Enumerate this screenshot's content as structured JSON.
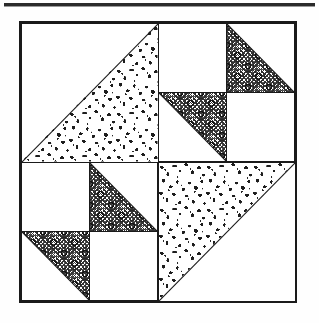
{
  "page": {
    "kind": "quilt-block-diagram",
    "width": 319,
    "height": 323,
    "background_color": "#fefefe"
  },
  "header_rule": {
    "visible": true,
    "color": "#2b2b2b"
  },
  "block": {
    "name": "quilt-block",
    "outline_color": "#1a1a1a",
    "background_color": "#ffffff",
    "grid": "2x2"
  },
  "fabrics": [
    {
      "id": "cloud",
      "label": "mottled print",
      "ink_color": "#1d1d1d",
      "ground_color": "#ffffff"
    },
    {
      "id": "medallion",
      "label": "geometric medallion print",
      "ink_color": "#141414",
      "ground_color": "#ffffff"
    },
    {
      "id": "plain",
      "label": "background solid",
      "ink_color": "none",
      "ground_color": "#ffffff"
    }
  ],
  "quadrants": [
    {
      "name": "top-left",
      "type": "half-square-triangle",
      "seam": "bl-tr",
      "patches": [
        {
          "position": "upper-left",
          "fabric": "plain"
        },
        {
          "position": "lower-right",
          "fabric": "cloud"
        }
      ]
    },
    {
      "name": "top-right",
      "type": "four-patch",
      "cells": [
        {
          "position": "top-left",
          "type": "plain",
          "fabric": "plain"
        },
        {
          "position": "top-right",
          "type": "half-square-triangle",
          "seam": "bl-tr",
          "fabric": "medallion",
          "fabric_half": "lower-left"
        },
        {
          "position": "bottom-left",
          "type": "half-square-triangle",
          "seam": "bl-tr",
          "fabric": "medallion",
          "fabric_half": "upper-right"
        },
        {
          "position": "bottom-right",
          "type": "plain",
          "fabric": "plain"
        }
      ]
    },
    {
      "name": "bottom-left",
      "type": "four-patch",
      "cells": [
        {
          "position": "top-left",
          "type": "plain",
          "fabric": "plain"
        },
        {
          "position": "top-right",
          "type": "half-square-triangle",
          "seam": "bl-tr",
          "fabric": "medallion",
          "fabric_half": "lower-left"
        },
        {
          "position": "bottom-left",
          "type": "half-square-triangle",
          "seam": "bl-tr",
          "fabric": "medallion",
          "fabric_half": "upper-right"
        },
        {
          "position": "bottom-right",
          "type": "plain",
          "fabric": "plain"
        }
      ]
    },
    {
      "name": "bottom-right",
      "type": "half-square-triangle",
      "seam": "tr-bl",
      "patches": [
        {
          "position": "upper-left",
          "fabric": "cloud"
        },
        {
          "position": "lower-right",
          "fabric": "plain"
        }
      ]
    }
  ]
}
